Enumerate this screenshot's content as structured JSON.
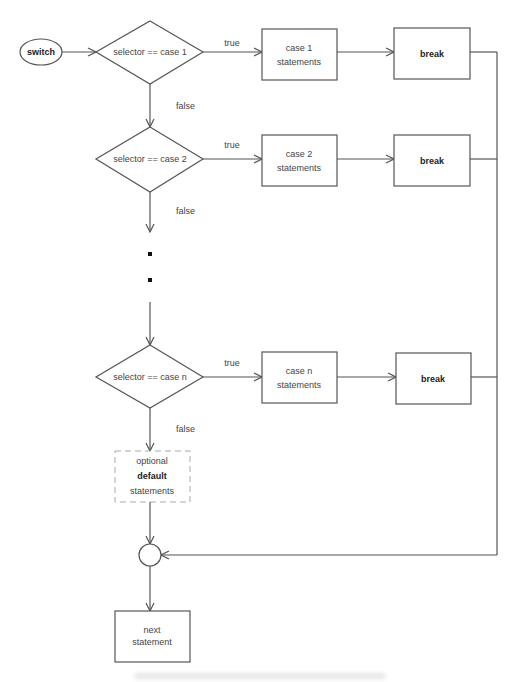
{
  "diagram": {
    "type": "flowchart",
    "start": {
      "label": "switch"
    },
    "decisions": [
      {
        "label": "selector == case 1",
        "true_label": "true",
        "false_label": "false"
      },
      {
        "label": "selector == case 2",
        "true_label": "true",
        "false_label": "false"
      },
      {
        "label": "selector == case n",
        "true_label": "true",
        "false_label": "false"
      }
    ],
    "case_boxes": [
      {
        "line1": "case 1",
        "line2": "statements"
      },
      {
        "line1": "case 2",
        "line2": "statements"
      },
      {
        "line1": "case n",
        "line2": "statements"
      }
    ],
    "break_boxes": [
      {
        "label": "break"
      },
      {
        "label": "break"
      },
      {
        "label": "break"
      }
    ],
    "default_box": {
      "line1": "optional",
      "line2": "default",
      "line3": "statements"
    },
    "end_box": {
      "line1": "next",
      "line2": "statement"
    }
  }
}
